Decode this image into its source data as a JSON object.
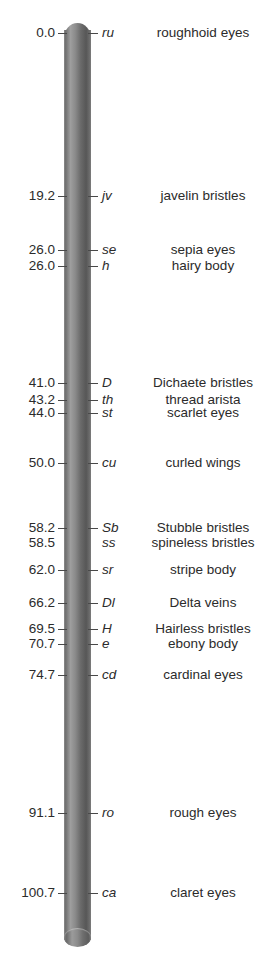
{
  "figure": {
    "bar_label": "chromosome",
    "colors": {
      "text": "#2b2b2b",
      "tick": "#494949",
      "chromosome_light": "#9e9e9e",
      "chromosome_dark": "#575757",
      "background": "#ffffff"
    }
  },
  "chart_data": {
    "type": "scatter",
    "title": "",
    "xlabel": "",
    "ylabel": "Map position (map units)",
    "ylim": [
      0.0,
      100.7
    ],
    "grid": false,
    "legend": null,
    "axis_labels": [
      "position",
      "symbol",
      "description"
    ],
    "categories": [
      "ru",
      "jv",
      "se",
      "h",
      "D",
      "th",
      "st",
      "cu",
      "Sb",
      "ss",
      "sr",
      "Dl",
      "H",
      "e",
      "cd",
      "ro",
      "ca"
    ],
    "values": [
      0.0,
      19.2,
      26.0,
      26.0,
      41.0,
      43.2,
      44.0,
      50.0,
      58.2,
      58.5,
      62.0,
      66.2,
      69.5,
      70.7,
      74.7,
      91.1,
      100.7
    ],
    "loci": [
      {
        "position": "0.0",
        "value": 0.0,
        "symbol": "ru",
        "description": "roughhoid eyes",
        "y": 33,
        "tick": true
      },
      {
        "position": "19.2",
        "value": 19.2,
        "symbol": "jv",
        "description": "javelin bristles",
        "y": 196,
        "tick": true
      },
      {
        "position": "26.0",
        "value": 26.0,
        "symbol": "se",
        "description": "sepia eyes",
        "y": 250,
        "tick": true
      },
      {
        "position": "26.0",
        "value": 26.0,
        "symbol": "h",
        "description": "hairy body",
        "y": 266,
        "tick": true
      },
      {
        "position": "41.0",
        "value": 41.0,
        "symbol": "D",
        "description": "Dichaete bristles",
        "y": 383,
        "tick": true
      },
      {
        "position": "43.2",
        "value": 43.2,
        "symbol": "th",
        "description": "thread arista",
        "y": 400,
        "tick": true
      },
      {
        "position": "44.0",
        "value": 44.0,
        "symbol": "st",
        "description": "scarlet eyes",
        "y": 413,
        "tick": true
      },
      {
        "position": "50.0",
        "value": 50.0,
        "symbol": "cu",
        "description": "curled wings",
        "y": 463,
        "tick": true
      },
      {
        "position": "58.2",
        "value": 58.2,
        "symbol": "Sb",
        "description": "Stubble bristles",
        "y": 528,
        "tick": true
      },
      {
        "position": "58.5",
        "value": 58.5,
        "symbol": "ss",
        "description": "spineless bristles",
        "y": 543,
        "tick": false
      },
      {
        "position": "62.0",
        "value": 62.0,
        "symbol": "sr",
        "description": "stripe body",
        "y": 570,
        "tick": true
      },
      {
        "position": "66.2",
        "value": 66.2,
        "symbol": "Dl",
        "description": "Delta veins",
        "y": 603,
        "tick": true
      },
      {
        "position": "69.5",
        "value": 69.5,
        "symbol": "H",
        "description": "Hairless bristles",
        "y": 629,
        "tick": true
      },
      {
        "position": "70.7",
        "value": 70.7,
        "symbol": "e",
        "description": "ebony body",
        "y": 644,
        "tick": true
      },
      {
        "position": "74.7",
        "value": 74.7,
        "symbol": "cd",
        "description": "cardinal eyes",
        "y": 675,
        "tick": true
      },
      {
        "position": "91.1",
        "value": 91.1,
        "symbol": "ro",
        "description": "rough eyes",
        "y": 813,
        "tick": true
      },
      {
        "position": "100.7",
        "value": 100.7,
        "symbol": "ca",
        "description": "claret eyes",
        "y": 893,
        "tick": true
      }
    ]
  }
}
